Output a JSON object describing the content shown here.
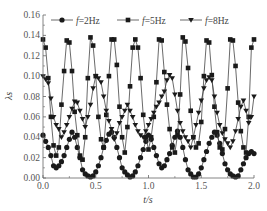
{
  "chart_data": {
    "type": "line",
    "title": "",
    "xlabel": "t/s",
    "ylabel": "λs",
    "xlim": [
      0.0,
      2.0
    ],
    "ylim": [
      0.0,
      0.16
    ],
    "xticks": [
      "0.0",
      "0.5",
      "1.0",
      "1.5",
      "2.0"
    ],
    "yticks": [
      "0.00",
      "0.02",
      "0.04",
      "0.06",
      "0.08",
      "0.10",
      "0.12",
      "0.14",
      "0.16"
    ],
    "grid": false,
    "legend_position": "top",
    "x": [
      0.0,
      0.025,
      0.05,
      0.075,
      0.1,
      0.125,
      0.15,
      0.175,
      0.2,
      0.225,
      0.25,
      0.275,
      0.3,
      0.325,
      0.35,
      0.375,
      0.4,
      0.425,
      0.45,
      0.475,
      0.5,
      0.525,
      0.55,
      0.575,
      0.6,
      0.625,
      0.65,
      0.675,
      0.7,
      0.725,
      0.75,
      0.775,
      0.8,
      0.825,
      0.85,
      0.875,
      0.9,
      0.925,
      0.95,
      0.975,
      1.0,
      1.025,
      1.05,
      1.075,
      1.1,
      1.125,
      1.15,
      1.175,
      1.2,
      1.225,
      1.25,
      1.275,
      1.3,
      1.325,
      1.35,
      1.375,
      1.4,
      1.425,
      1.45,
      1.475,
      1.5,
      1.525,
      1.55,
      1.575,
      1.6,
      1.625,
      1.65,
      1.675,
      1.7,
      1.725,
      1.75,
      1.775,
      1.8,
      1.825,
      1.85,
      1.875,
      1.9,
      1.925,
      1.95,
      1.975,
      2.0
    ],
    "series": [
      {
        "name": "f=2Hz",
        "marker": "circle",
        "values": [
          0.042,
          0.036,
          0.03,
          0.022,
          0.012,
          0.01,
          0.012,
          0.016,
          0.022,
          0.03,
          0.038,
          0.045,
          0.04,
          0.03,
          0.02,
          0.008,
          0.004,
          0.002,
          0.001,
          0.002,
          0.006,
          0.012,
          0.02,
          0.03,
          0.037,
          0.043,
          0.045,
          0.04,
          0.03,
          0.02,
          0.01,
          0.006,
          0.003,
          0.001,
          0.002,
          0.006,
          0.012,
          0.02,
          0.028,
          0.036,
          0.042,
          0.038,
          0.03,
          0.022,
          0.014,
          0.01,
          0.012,
          0.018,
          0.024,
          0.032,
          0.04,
          0.046,
          0.04,
          0.03,
          0.018,
          0.008,
          0.004,
          0.001,
          0.001,
          0.004,
          0.01,
          0.018,
          0.026,
          0.034,
          0.04,
          0.045,
          0.042,
          0.034,
          0.024,
          0.014,
          0.008,
          0.004,
          0.002,
          0.001,
          0.002,
          0.008,
          0.014,
          0.02,
          0.024,
          0.026,
          0.024
        ]
      },
      {
        "name": "f=5Hz",
        "marker": "square",
        "values": [
          0.136,
          0.128,
          0.098,
          0.06,
          0.032,
          0.022,
          0.03,
          0.072,
          0.105,
          0.135,
          0.133,
          0.105,
          0.065,
          0.042,
          0.022,
          0.018,
          0.04,
          0.098,
          0.138,
          0.13,
          0.1,
          0.06,
          0.038,
          0.03,
          0.062,
          0.1,
          0.136,
          0.136,
          0.111,
          0.07,
          0.04,
          0.025,
          0.05,
          0.09,
          0.128,
          0.136,
          0.128,
          0.098,
          0.062,
          0.04,
          0.028,
          0.04,
          0.06,
          0.094,
          0.136,
          0.135,
          0.104,
          0.072,
          0.048,
          0.03,
          0.025,
          0.042,
          0.082,
          0.138,
          0.134,
          0.108,
          0.066,
          0.04,
          0.03,
          0.034,
          0.055,
          0.1,
          0.135,
          0.133,
          0.101,
          0.07,
          0.045,
          0.03,
          0.028,
          0.048,
          0.088,
          0.136,
          0.135,
          0.11,
          0.074,
          0.046,
          0.03,
          0.025,
          0.06,
          0.128,
          0.136
        ]
      },
      {
        "name": "f=8Hz",
        "marker": "triangle-down",
        "values": [
          0.1,
          0.097,
          0.093,
          0.078,
          0.06,
          0.052,
          0.048,
          0.04,
          0.045,
          0.052,
          0.06,
          0.068,
          0.075,
          0.074,
          0.066,
          0.058,
          0.05,
          0.06,
          0.072,
          0.088,
          0.1,
          0.098,
          0.094,
          0.08,
          0.066,
          0.056,
          0.048,
          0.038,
          0.044,
          0.054,
          0.06,
          0.066,
          0.072,
          0.066,
          0.06,
          0.052,
          0.046,
          0.042,
          0.04,
          0.046,
          0.052,
          0.058,
          0.064,
          0.07,
          0.074,
          0.08,
          0.085,
          0.096,
          0.101,
          0.098,
          0.082,
          0.066,
          0.054,
          0.046,
          0.04,
          0.036,
          0.03,
          0.04,
          0.052,
          0.064,
          0.076,
          0.088,
          0.096,
          0.099,
          0.096,
          0.08,
          0.064,
          0.052,
          0.044,
          0.038,
          0.034,
          0.03,
          0.036,
          0.046,
          0.058,
          0.07,
          0.076,
          0.066,
          0.054,
          0.06,
          0.08
        ]
      }
    ]
  },
  "legend": {
    "items": [
      {
        "label": "f=2Hz",
        "marker": "circle"
      },
      {
        "label": "f=5Hz",
        "marker": "square"
      },
      {
        "label": "f=8Hz",
        "marker": "triangle-down"
      }
    ]
  },
  "colors": {
    "series": "#1a1a1a",
    "line": "#444444",
    "axis": "#666666",
    "text": "#555555"
  }
}
